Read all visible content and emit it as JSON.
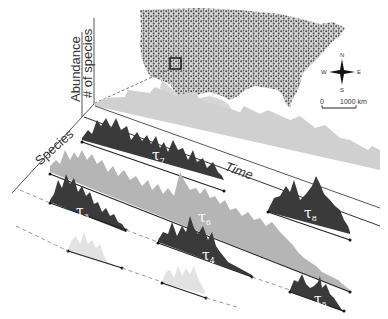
{
  "figure": {
    "axes": {
      "abundance_label": "Abundance",
      "species_count_label": "# of species",
      "species_label": "Species",
      "time_label": "Time"
    },
    "map": {
      "region": "United States",
      "compass": {
        "n": "N",
        "s": "S",
        "e": "E",
        "w": "W"
      },
      "scale": {
        "start": "0",
        "end": "1000 km"
      }
    },
    "segments": [
      {
        "id": "tau7",
        "symbol": "τ",
        "index": "7",
        "tone": "dark",
        "row": 1
      },
      {
        "id": "tau8",
        "symbol": "τ",
        "index": "8",
        "tone": "dark",
        "row": 1
      },
      {
        "id": "tau6",
        "symbol": "τ",
        "index": "6",
        "tone": "medium",
        "row": 2
      },
      {
        "id": "tau3",
        "symbol": "τ",
        "index": "3",
        "tone": "dark",
        "row": 3
      },
      {
        "id": "tau4",
        "symbol": "τ",
        "index": "4",
        "tone": "dark",
        "row": 3
      },
      {
        "id": "tau1",
        "symbol": "τ",
        "index": "1",
        "tone": "light",
        "row": 4
      },
      {
        "id": "tau2",
        "symbol": "τ",
        "index": "2",
        "tone": "light",
        "row": 4
      },
      {
        "id": "tau5",
        "symbol": "τ",
        "index": "5",
        "tone": "dark",
        "row": 4
      }
    ],
    "colors": {
      "dark": "#3a3a3a",
      "medium": "#b5b5b5",
      "light": "#e2e2e2",
      "map_dots": "#4a4a4a",
      "map_land": "#d6d6d6"
    }
  }
}
